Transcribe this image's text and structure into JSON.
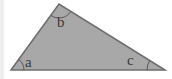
{
  "figure": {
    "name": "triangle-angle-diagram",
    "caption": "",
    "width": 172,
    "height": 79,
    "background_color": "#ffffff",
    "fill_color": "#a8a8a8",
    "stroke_color": "#6e6e6e",
    "arc_color": "#585858",
    "label_color": "#3a3a3a",
    "shape": "triangle",
    "vertices": [
      {
        "id": "a",
        "x": 11,
        "y": 70,
        "position": "bottom-left"
      },
      {
        "id": "b",
        "x": 59,
        "y": 4,
        "position": "top"
      },
      {
        "id": "c",
        "x": 165,
        "y": 70,
        "position": "bottom-right"
      }
    ],
    "angle_labels": [
      {
        "id": "a",
        "text": "a",
        "x": 25,
        "y": 55
      },
      {
        "id": "b",
        "text": "b",
        "x": 57,
        "y": 15
      },
      {
        "id": "c",
        "text": "c",
        "x": 127,
        "y": 53
      }
    ],
    "angle_arcs": [
      {
        "id": "a",
        "at_vertex": "a",
        "radius": 13
      },
      {
        "id": "b",
        "at_vertex": "b",
        "radius": 14
      },
      {
        "id": "c",
        "at_vertex": "c",
        "radius": 18
      }
    ],
    "left_edge_band_color": "#ececec"
  }
}
